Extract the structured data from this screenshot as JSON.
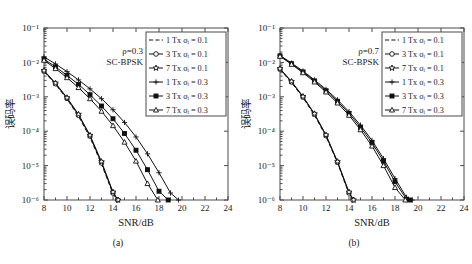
{
  "figure": {
    "background": "#ffffff",
    "line_color": "#111111",
    "axis_color": "#4a4a4a"
  },
  "panels": [
    {
      "id": "a",
      "subcaption": "(a)",
      "annotation_rho": "ρ=0.3",
      "annotation_mod": "SC-BPSK",
      "chart_data": {
        "type": "line",
        "title": "",
        "subtitle": "ρ=0.3  SC-BPSK",
        "xlabel": "SNR/dB",
        "ylabel": "误码率",
        "yscale": "log",
        "xlim": [
          8,
          24
        ],
        "ylim": [
          1e-06,
          0.1
        ],
        "xticks": [
          8,
          10,
          12,
          14,
          16,
          18,
          20,
          22,
          24
        ],
        "yticks": [
          0.1,
          0.01,
          0.001,
          0.0001,
          1e-05,
          1e-06
        ],
        "yticklabels": [
          "10⁻¹",
          "10⁻²",
          "10⁻³",
          "10⁻⁴",
          "10⁻⁵",
          "10⁻⁶"
        ],
        "grid": false,
        "legend_position": "upper right",
        "series": [
          {
            "name": "1 Tx σᵢ = 0.1",
            "marker": "none",
            "linestyle": "dashed",
            "x": [
              8,
              9,
              10,
              11,
              12,
              13,
              14,
              14.3
            ],
            "y": [
              0.0054,
              0.0023,
              0.00086,
              0.00027,
              6.6e-05,
              1.1e-05,
              1.5e-06,
              1e-06
            ]
          },
          {
            "name": "3 Tx σᵢ = 0.1",
            "marker": "circle-open",
            "linestyle": "solid",
            "x": [
              8,
              9,
              10,
              11,
              12,
              13,
              14,
              14.4
            ],
            "y": [
              0.0056,
              0.0024,
              0.0009,
              0.00029,
              7.2e-05,
              1.2e-05,
              1.6e-06,
              1e-06
            ]
          },
          {
            "name": "7 Tx σᵢ = 0.1",
            "marker": "star-open",
            "linestyle": "solid",
            "x": [
              8,
              9,
              10,
              11,
              12,
              13,
              14,
              14.45
            ],
            "y": [
              0.0058,
              0.0025,
              0.00094,
              0.00031,
              7.6e-05,
              1.3e-05,
              1.7e-06,
              1e-06
            ]
          },
          {
            "name": "1 Tx σᵢ = 0.3",
            "marker": "plus",
            "linestyle": "solid",
            "x": [
              8,
              9,
              10,
              11,
              12,
              13,
              14,
              15,
              16,
              17,
              18,
              19,
              19.7
            ],
            "y": [
              0.0145,
              0.009,
              0.0054,
              0.0031,
              0.0017,
              0.00088,
              0.00042,
              0.00018,
              6.8e-05,
              2.2e-05,
              6.2e-06,
              1.6e-06,
              1e-06
            ]
          },
          {
            "name": "3 Tx σᵢ = 0.3",
            "marker": "square-filled",
            "linestyle": "solid",
            "x": [
              8,
              9,
              10,
              11,
              12,
              13,
              14,
              15,
              16,
              17,
              18,
              18.8
            ],
            "y": [
              0.0125,
              0.0074,
              0.0042,
              0.0023,
              0.00115,
              0.00054,
              0.00023,
              8.6e-05,
              2.8e-05,
              7.6e-06,
              1.8e-06,
              1e-06
            ]
          },
          {
            "name": "7 Tx σᵢ = 0.3",
            "marker": "triangle-open",
            "linestyle": "solid",
            "x": [
              8,
              9,
              10,
              11,
              12,
              13,
              14,
              15,
              16,
              17,
              17.9
            ],
            "y": [
              0.0115,
              0.0066,
              0.0036,
              0.00185,
              0.00088,
              0.00038,
              0.000145,
              4.8e-05,
              1.35e-05,
              3e-06,
              1e-06
            ]
          }
        ]
      }
    },
    {
      "id": "b",
      "subcaption": "(b)",
      "annotation_rho": "ρ=0.7",
      "annotation_mod": "SC-BPSK",
      "chart_data": {
        "type": "line",
        "title": "",
        "subtitle": "ρ=0.7  SC-BPSK",
        "xlabel": "SNR/dB",
        "ylabel": "误码率",
        "yscale": "log",
        "xlim": [
          8,
          24
        ],
        "ylim": [
          1e-06,
          0.1
        ],
        "xticks": [
          8,
          10,
          12,
          14,
          16,
          18,
          20,
          22,
          24
        ],
        "yticks": [
          0.1,
          0.01,
          0.001,
          0.0001,
          1e-05,
          1e-06
        ],
        "yticklabels": [
          "10⁻¹",
          "10⁻²",
          "10⁻³",
          "10⁻⁴",
          "10⁻⁵",
          "10⁻⁶"
        ],
        "grid": false,
        "legend_position": "upper right",
        "series": [
          {
            "name": "1 Tx σᵢ = 0.1",
            "marker": "none",
            "linestyle": "dashed",
            "x": [
              8,
              9,
              10,
              11,
              12,
              13,
              14,
              14.25
            ],
            "y": [
              0.0062,
              0.0026,
              0.00094,
              0.00029,
              7e-05,
              1.2e-05,
              1.5e-06,
              1e-06
            ]
          },
          {
            "name": "3 Tx σᵢ = 0.1",
            "marker": "circle-open",
            "linestyle": "solid",
            "x": [
              8,
              9,
              10,
              11,
              12,
              13,
              14,
              14.35
            ],
            "y": [
              0.0064,
              0.0027,
              0.00098,
              0.00031,
              7.4e-05,
              1.25e-05,
              1.6e-06,
              1e-06
            ]
          },
          {
            "name": "7 Tx σᵢ = 0.1",
            "marker": "star-open",
            "linestyle": "solid",
            "x": [
              8,
              9,
              10,
              11,
              12,
              13,
              14,
              14.4
            ],
            "y": [
              0.0066,
              0.0028,
              0.00102,
              0.00032,
              7.8e-05,
              1.3e-05,
              1.7e-06,
              1e-06
            ]
          },
          {
            "name": "1 Tx σᵢ = 0.3",
            "marker": "plus",
            "linestyle": "solid",
            "x": [
              8,
              9,
              10,
              11,
              12,
              13,
              14,
              15,
              16,
              17,
              18,
              19,
              19.5
            ],
            "y": [
              0.016,
              0.0096,
              0.0056,
              0.0031,
              0.00165,
              0.00082,
              0.00037,
              0.00015,
              5.4e-05,
              1.6e-05,
              4.2e-06,
              1.2e-06,
              1e-06
            ]
          },
          {
            "name": "3 Tx σᵢ = 0.3",
            "marker": "square-filled",
            "linestyle": "solid",
            "x": [
              8,
              9,
              10,
              11,
              12,
              13,
              14,
              15,
              16,
              17,
              18,
              19,
              19.3
            ],
            "y": [
              0.0155,
              0.0092,
              0.0053,
              0.0029,
              0.0015,
              0.00074,
              0.00033,
              0.00013,
              4.6e-05,
              1.35e-05,
              3.4e-06,
              1.05e-06,
              1e-06
            ]
          },
          {
            "name": "7 Tx σᵢ = 0.3",
            "marker": "triangle-open",
            "linestyle": "solid",
            "x": [
              8,
              9,
              10,
              11,
              12,
              13,
              14,
              15,
              16,
              17,
              18,
              18.9
            ],
            "y": [
              0.015,
              0.0088,
              0.005,
              0.0027,
              0.00138,
              0.00066,
              0.00029,
              0.00011,
              3.7e-05,
              1e-05,
              2.3e-06,
              1e-06
            ]
          }
        ]
      }
    }
  ]
}
